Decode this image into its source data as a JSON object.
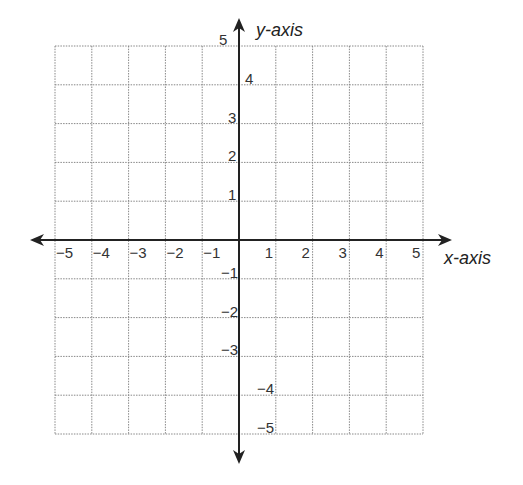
{
  "chart_data": {
    "type": "scatter",
    "title": "",
    "xlabel": "x-axis",
    "ylabel": "y-axis",
    "xlim": [
      -5,
      5
    ],
    "ylim": [
      -5,
      5
    ],
    "grid": true,
    "grid_style": "dotted",
    "x_ticks": [
      -5,
      -4,
      -3,
      -2,
      -1,
      1,
      2,
      3,
      4,
      5
    ],
    "y_ticks": [
      -5,
      -4,
      -3,
      -2,
      -1,
      1,
      2,
      3,
      4,
      5
    ],
    "x_tick_labels": [
      "−5",
      "−4",
      "−3",
      "−2",
      "−1",
      "1",
      "2",
      "3",
      "4",
      "5"
    ],
    "y_tick_labels": [
      "−5",
      "−4",
      "−3",
      "−2",
      "−1",
      "1",
      "2",
      "3",
      "4",
      "5"
    ],
    "series": [],
    "legend": null
  },
  "colors": {
    "axis": "#222222",
    "grid": "#888888",
    "text": "#333333"
  },
  "labels": {
    "x_axis": "x-axis",
    "y_axis": "y-axis"
  }
}
